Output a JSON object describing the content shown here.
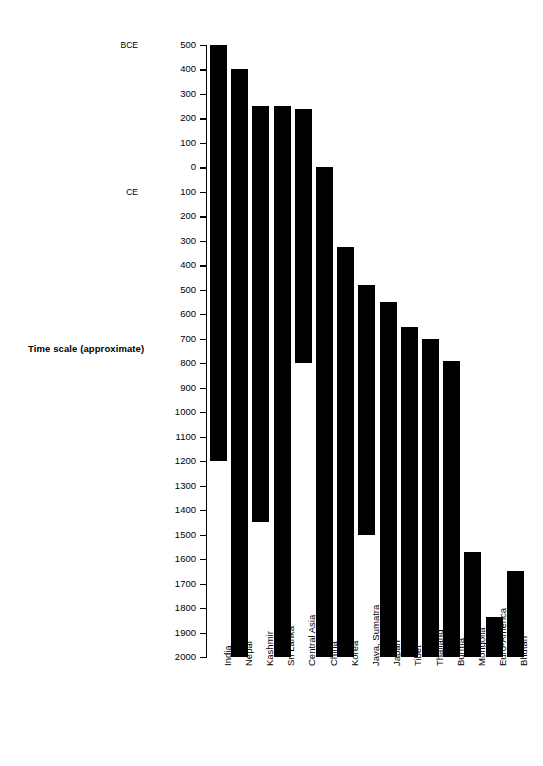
{
  "chart_data": {
    "type": "bar",
    "title": "",
    "subtitle": "",
    "ylabel": "Time scale (approximate)",
    "xlabel": "",
    "orientation": "vertical-range",
    "grid": false,
    "legend": null,
    "axis_note_top": "BCE",
    "axis_note_bottom": "CE",
    "yaxis": {
      "top_value": -500,
      "bottom_value": 2000,
      "tick_interval": 100,
      "inverted": true,
      "tick_labels": [
        "500",
        "400",
        "300",
        "200",
        "100",
        "0",
        "100",
        "200",
        "300",
        "400",
        "500",
        "600",
        "700",
        "800",
        "900",
        "1000",
        "1100",
        "1200",
        "1300",
        "1400",
        "1500",
        "1600",
        "1700",
        "1800",
        "1900",
        "2000"
      ],
      "era_markers": [
        {
          "label": "BCE",
          "at_tick": "500"
        },
        {
          "label": "CE",
          "at_tick": "100"
        }
      ]
    },
    "categories": [
      "India",
      "Nepal",
      "Kashmir",
      "Sri Lanka",
      "Central Asia",
      "China",
      "Korea",
      "Java, Sumatra",
      "Japan",
      "Tibet",
      "Thailand",
      "Burma",
      "Mongolia",
      "Euro-America",
      "Bhutan"
    ],
    "bars": [
      {
        "category": "India",
        "start": -500,
        "end": 1200
      },
      {
        "category": "Nepal",
        "start": -400,
        "end": 2000
      },
      {
        "category": "Kashmir",
        "start": -250,
        "end": 1450
      },
      {
        "category": "Sri Lanka",
        "start": -250,
        "end": 2000
      },
      {
        "category": "Central Asia",
        "start": -240,
        "end": 800
      },
      {
        "category": "China",
        "start": 0,
        "end": 2000
      },
      {
        "category": "Korea",
        "start": 325,
        "end": 2000
      },
      {
        "category": "Java, Sumatra",
        "start": 480,
        "end": 1500
      },
      {
        "category": "Japan",
        "start": 550,
        "end": 2000
      },
      {
        "category": "Tibet",
        "start": 650,
        "end": 2000
      },
      {
        "category": "Thailand",
        "start": 700,
        "end": 2000
      },
      {
        "category": "Burma",
        "start": 790,
        "end": 2000
      },
      {
        "category": "Mongolia",
        "start": 1570,
        "end": 2000
      },
      {
        "category": "Euro-America",
        "start": 1835,
        "end": 2000
      },
      {
        "category": "Bhutan",
        "start": 1650,
        "end": 2000
      }
    ],
    "colors": {
      "bar": "#000000",
      "axis": "#000000",
      "background": "#ffffff",
      "text": "#000000"
    }
  }
}
